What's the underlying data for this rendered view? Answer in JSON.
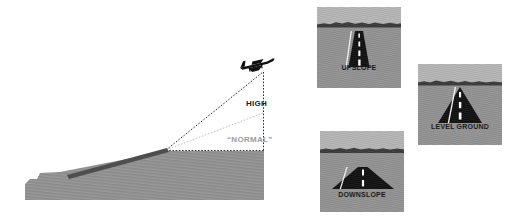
{
  "figure": {
    "type": "diagram",
    "background_color": "#ffffff"
  },
  "sideview": {
    "name": "approach-angle-side-view",
    "aircraft_icon": "airplane-icon",
    "terrain_color": "#919191",
    "runway_color": "#4a4a4a",
    "labels": {
      "high": "HIGH",
      "normal": "“NORMAL”"
    },
    "label_colors": {
      "high": "#1c1c1c",
      "normal": "#9b9b9b"
    },
    "guides": [
      {
        "name": "upslope-glidepath-line",
        "style": "dotted",
        "color": "#2b2b2b"
      },
      {
        "name": "normal-glidepath-line",
        "style": "dotted",
        "color": "#bdbdbd"
      },
      {
        "name": "vertical-height-line",
        "style": "dotted",
        "color": "#2b2b2b"
      },
      {
        "name": "horizontal-baseline",
        "style": "dotted",
        "color": "#2b2b2b"
      }
    ]
  },
  "panels": [
    {
      "id": "upslope",
      "label": "UPSLOPE",
      "road_shape": "narrow-tall-trapezoid",
      "centerline_dashes": 4,
      "sky_color": "#b4b4b4",
      "ground_color": "#919191",
      "road_color": "#111111",
      "dash_color": "#ffffff"
    },
    {
      "id": "level-ground",
      "label": "LEVEL GROUND",
      "road_shape": "medium-triangle",
      "centerline_dashes": 3,
      "sky_color": "#b4b4b4",
      "ground_color": "#919191",
      "road_color": "#111111",
      "dash_color": "#ffffff"
    },
    {
      "id": "downslope",
      "label": "DOWNSLOPE",
      "road_shape": "wide-flat-trapezoid",
      "centerline_dashes": 2,
      "sky_color": "#b4b4b4",
      "ground_color": "#919191",
      "road_color": "#111111",
      "dash_color": "#ffffff"
    }
  ]
}
